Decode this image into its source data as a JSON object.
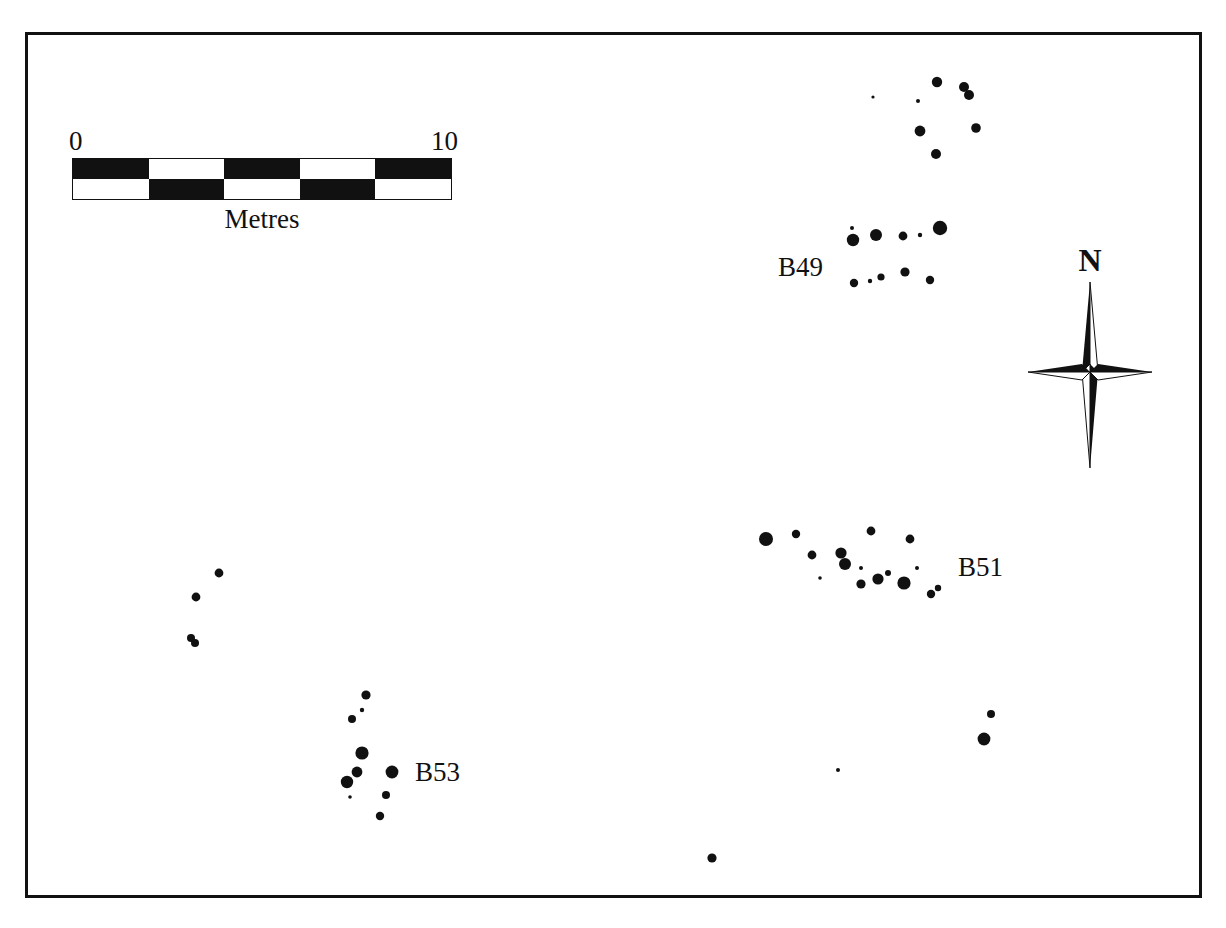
{
  "figure": {
    "type": "archaeological-site-distribution-plan",
    "background": "#ffffff",
    "ink_color": "#111111",
    "frame": {
      "x": 25,
      "y": 32,
      "width": 1177,
      "height": 866,
      "border_px": 3
    }
  },
  "scale_bar": {
    "name": "scale-bar",
    "start_label": "0",
    "end_label": "10",
    "caption": "Metres",
    "segments": 5,
    "rows": 2,
    "pattern_top": [
      "filled",
      "empty",
      "filled",
      "empty",
      "filled"
    ],
    "pattern_bottom": [
      "empty",
      "filled",
      "empty",
      "filled",
      "empty"
    ],
    "x": 72,
    "y": 158,
    "width": 380,
    "height": 42
  },
  "north_arrow": {
    "name": "north-arrow",
    "label": "N",
    "x": 1020,
    "y": 242,
    "width": 140,
    "height": 230
  },
  "cluster_labels": [
    {
      "id": "B49",
      "text": "B49",
      "x": 778,
      "y": 252
    },
    {
      "id": "B51",
      "text": "B51",
      "x": 958,
      "y": 552
    },
    {
      "id": "B53",
      "text": "B53",
      "x": 415,
      "y": 757
    }
  ],
  "chart_data": {
    "type": "scatter",
    "title": "",
    "subtitle": "",
    "xlabel": "",
    "ylabel": "",
    "grid": false,
    "legend": null,
    "axis_units": "metres",
    "scale": {
      "bar_length_px": 380,
      "bar_length_m": 10,
      "px_per_metre": 38
    },
    "annotations": [
      {
        "text": "B49",
        "x": 778,
        "y": 252
      },
      {
        "text": "B51",
        "x": 958,
        "y": 552
      },
      {
        "text": "B53",
        "x": 415,
        "y": 757
      },
      {
        "text": "N",
        "x": 1090,
        "y": 258
      },
      {
        "text": "0",
        "x": 72,
        "y": 140
      },
      {
        "text": "10",
        "x": 452,
        "y": 140
      },
      {
        "text": "Metres",
        "x": 262,
        "y": 222
      }
    ],
    "series": [
      {
        "name": "find-spots",
        "marker": "filled-circle",
        "color": "#111111",
        "points": [
          {
            "x": 873,
            "y": 97,
            "r": 1.6,
            "group": "B49-north"
          },
          {
            "x": 918,
            "y": 101,
            "r": 2.0,
            "group": "B49-north"
          },
          {
            "x": 937,
            "y": 82,
            "r": 5.2,
            "group": "B49-north"
          },
          {
            "x": 964,
            "y": 87,
            "r": 5.0,
            "group": "B49-north"
          },
          {
            "x": 969,
            "y": 95,
            "r": 5.0,
            "group": "B49-north"
          },
          {
            "x": 920,
            "y": 131,
            "r": 5.4,
            "group": "B49-north"
          },
          {
            "x": 976,
            "y": 128,
            "r": 4.8,
            "group": "B49-north"
          },
          {
            "x": 936,
            "y": 154,
            "r": 5.0,
            "group": "B49-north"
          },
          {
            "x": 853,
            "y": 240,
            "r": 6.2,
            "group": "B49-main"
          },
          {
            "x": 852,
            "y": 228,
            "r": 2.0,
            "group": "B49-main"
          },
          {
            "x": 876,
            "y": 235,
            "r": 6.0,
            "group": "B49-main"
          },
          {
            "x": 903,
            "y": 236,
            "r": 4.4,
            "group": "B49-main"
          },
          {
            "x": 920,
            "y": 235,
            "r": 2.2,
            "group": "B49-main"
          },
          {
            "x": 940,
            "y": 228,
            "r": 7.2,
            "group": "B49-main"
          },
          {
            "x": 854,
            "y": 283,
            "r": 4.2,
            "group": "B49-main"
          },
          {
            "x": 870,
            "y": 281,
            "r": 2.2,
            "group": "B49-main"
          },
          {
            "x": 881,
            "y": 277,
            "r": 3.6,
            "group": "B49-main"
          },
          {
            "x": 905,
            "y": 272,
            "r": 4.6,
            "group": "B49-main"
          },
          {
            "x": 930,
            "y": 280,
            "r": 4.2,
            "group": "B49-main"
          },
          {
            "x": 766,
            "y": 539,
            "r": 7.0,
            "group": "B51"
          },
          {
            "x": 796,
            "y": 534,
            "r": 4.2,
            "group": "B51"
          },
          {
            "x": 871,
            "y": 531,
            "r": 4.4,
            "group": "B51"
          },
          {
            "x": 910,
            "y": 539,
            "r": 4.4,
            "group": "B51"
          },
          {
            "x": 812,
            "y": 555,
            "r": 4.4,
            "group": "B51"
          },
          {
            "x": 841,
            "y": 553,
            "r": 5.6,
            "group": "B51"
          },
          {
            "x": 845,
            "y": 564,
            "r": 6.0,
            "group": "B51"
          },
          {
            "x": 861,
            "y": 568,
            "r": 2.0,
            "group": "B51"
          },
          {
            "x": 820,
            "y": 578,
            "r": 1.8,
            "group": "B51"
          },
          {
            "x": 861,
            "y": 584,
            "r": 4.6,
            "group": "B51"
          },
          {
            "x": 878,
            "y": 579,
            "r": 5.6,
            "group": "B51"
          },
          {
            "x": 888,
            "y": 573,
            "r": 3.0,
            "group": "B51"
          },
          {
            "x": 904,
            "y": 583,
            "r": 6.6,
            "group": "B51"
          },
          {
            "x": 917,
            "y": 568,
            "r": 2.0,
            "group": "B51"
          },
          {
            "x": 931,
            "y": 594,
            "r": 4.2,
            "group": "B51"
          },
          {
            "x": 938,
            "y": 588,
            "r": 3.2,
            "group": "B51"
          },
          {
            "x": 366,
            "y": 695,
            "r": 4.6,
            "group": "B53"
          },
          {
            "x": 362,
            "y": 710,
            "r": 2.2,
            "group": "B53"
          },
          {
            "x": 352,
            "y": 719,
            "r": 4.0,
            "group": "B53"
          },
          {
            "x": 362,
            "y": 753,
            "r": 6.6,
            "group": "B53"
          },
          {
            "x": 357,
            "y": 772,
            "r": 5.4,
            "group": "B53"
          },
          {
            "x": 347,
            "y": 782,
            "r": 6.2,
            "group": "B53"
          },
          {
            "x": 350,
            "y": 797,
            "r": 1.8,
            "group": "B53"
          },
          {
            "x": 392,
            "y": 772,
            "r": 6.4,
            "group": "B53"
          },
          {
            "x": 386,
            "y": 795,
            "r": 4.0,
            "group": "B53"
          },
          {
            "x": 380,
            "y": 816,
            "r": 4.2,
            "group": "B53"
          },
          {
            "x": 219,
            "y": 573,
            "r": 4.4,
            "group": "west-outliers"
          },
          {
            "x": 196,
            "y": 597,
            "r": 4.4,
            "group": "west-outliers"
          },
          {
            "x": 191,
            "y": 638,
            "r": 4.0,
            "group": "west-outliers"
          },
          {
            "x": 195,
            "y": 643,
            "r": 4.0,
            "group": "west-outliers"
          },
          {
            "x": 991,
            "y": 714,
            "r": 4.0,
            "group": "east-outliers"
          },
          {
            "x": 984,
            "y": 739,
            "r": 6.4,
            "group": "east-outliers"
          },
          {
            "x": 838,
            "y": 770,
            "r": 2.0,
            "group": "stray"
          },
          {
            "x": 712,
            "y": 858,
            "r": 4.6,
            "group": "stray"
          }
        ]
      }
    ]
  }
}
